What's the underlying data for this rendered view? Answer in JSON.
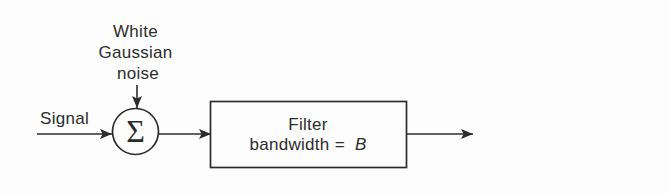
{
  "figure": {
    "type": "block-diagram",
    "background_color": "#fdfdfd",
    "ink_color": "#2c2c2c",
    "noise_label": {
      "line1": "White",
      "line2": "Gaussian",
      "line3": "noise"
    },
    "signal_label": "Signal",
    "summer_symbol": "Σ",
    "filter_box": {
      "line1": "Filter",
      "line2_prefix": "bandwidth =",
      "line2_var": "B"
    }
  }
}
